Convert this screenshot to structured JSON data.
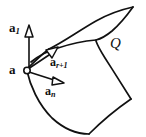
{
  "figure": {
    "caption_type": "geometry-diagram",
    "width": 146,
    "height": 137,
    "background_color": "#ffffff",
    "stroke_color": "#111111",
    "labels": {
      "vector_a1_base": "a",
      "vector_a1_sub": "1",
      "point_a": "a",
      "vector_ar1_base": "a",
      "vector_ar1_sub": "r+1",
      "vector_an_base": "a",
      "vector_an_sub": "n",
      "surface_q": "Q"
    },
    "elements": {
      "point_marker": "open-circle",
      "vector_a1_direction": "up",
      "vector_ar1_direction": "up-right",
      "vector_an_direction": "right-down",
      "upper_surface": "flat-quadrilateral-sheet",
      "lower_surface": "curved-sheet"
    }
  }
}
